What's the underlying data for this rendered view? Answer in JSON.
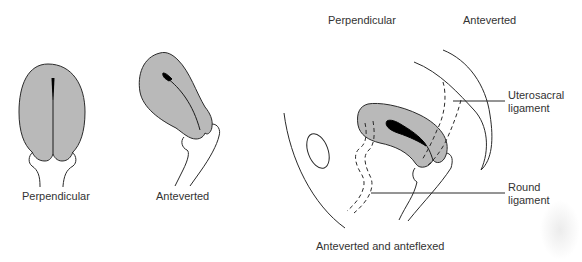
{
  "figure": {
    "panels": [
      {
        "id": "perpendicular",
        "caption": "Perpendicular"
      },
      {
        "id": "anteverted",
        "caption": "Anteverted"
      },
      {
        "id": "anteverted-anteflexed",
        "caption": "Anteverted and anteflexed",
        "header_labels": [
          "Perpendicular",
          "Anteverted"
        ],
        "callouts": [
          {
            "id": "uterosacral",
            "line1": "Uterosacral",
            "line2": "ligament"
          },
          {
            "id": "round",
            "line1": "Round",
            "line2": "ligament"
          }
        ]
      }
    ],
    "colors": {
      "uterus_fill": "#b9b9b9",
      "outline": "#2a2a2a",
      "cavity": "#000000",
      "text": "#333333"
    }
  }
}
